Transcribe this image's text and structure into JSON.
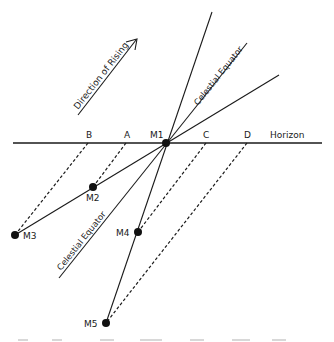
{
  "diagram": {
    "arrow_label": "Direction of Rising",
    "horizon_label": "Horizon",
    "equator_label_upper": "Celestial Equator",
    "equator_label_lower": "Celestial Equator",
    "horizon_points": {
      "B": "B",
      "A": "A",
      "C": "C",
      "D": "D"
    },
    "moon_positions": {
      "M1": "M1",
      "M2": "M2",
      "M3": "M3",
      "M4": "M4",
      "M5": "M5"
    },
    "colors": {
      "ink": "#1a1a1a",
      "background": "#ffffff"
    }
  }
}
